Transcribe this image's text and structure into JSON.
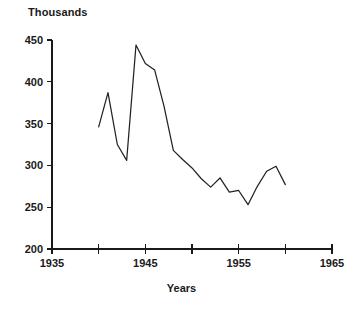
{
  "chart_data": {
    "type": "line",
    "title": "",
    "ylabel": "Thousands",
    "xlabel": "Years",
    "grid": false,
    "legend": null,
    "xlim": [
      1935,
      1965
    ],
    "ylim": [
      200,
      450
    ],
    "x_ticks": [
      1935,
      1940,
      1945,
      1950,
      1955,
      1960,
      1965
    ],
    "x_tick_labels": [
      "1935",
      "",
      "1945",
      "",
      "1955",
      "",
      "1965"
    ],
    "y_ticks": [
      200,
      250,
      300,
      350,
      400,
      450
    ],
    "y_tick_labels": [
      "200",
      "250",
      "300",
      "350",
      "400",
      "450"
    ],
    "x": [
      1940,
      1941,
      1942,
      1943,
      1944,
      1945,
      1946,
      1947,
      1948,
      1949,
      1950,
      1951,
      1952,
      1953,
      1954,
      1955,
      1956,
      1957,
      1958,
      1959,
      1960
    ],
    "values": [
      346,
      387,
      325,
      306,
      444,
      422,
      414,
      371,
      318,
      307,
      297,
      284,
      274,
      285,
      268,
      270,
      253,
      275,
      293,
      299,
      277
    ],
    "series": [
      {
        "name": "Thousands",
        "values": [
          346,
          387,
          325,
          306,
          444,
          422,
          414,
          371,
          318,
          307,
          297,
          284,
          274,
          285,
          268,
          270,
          253,
          275,
          293,
          299,
          277
        ]
      }
    ],
    "line_color": "#222222"
  },
  "axis_titles": {
    "y": "Thousands",
    "x": "Years"
  }
}
